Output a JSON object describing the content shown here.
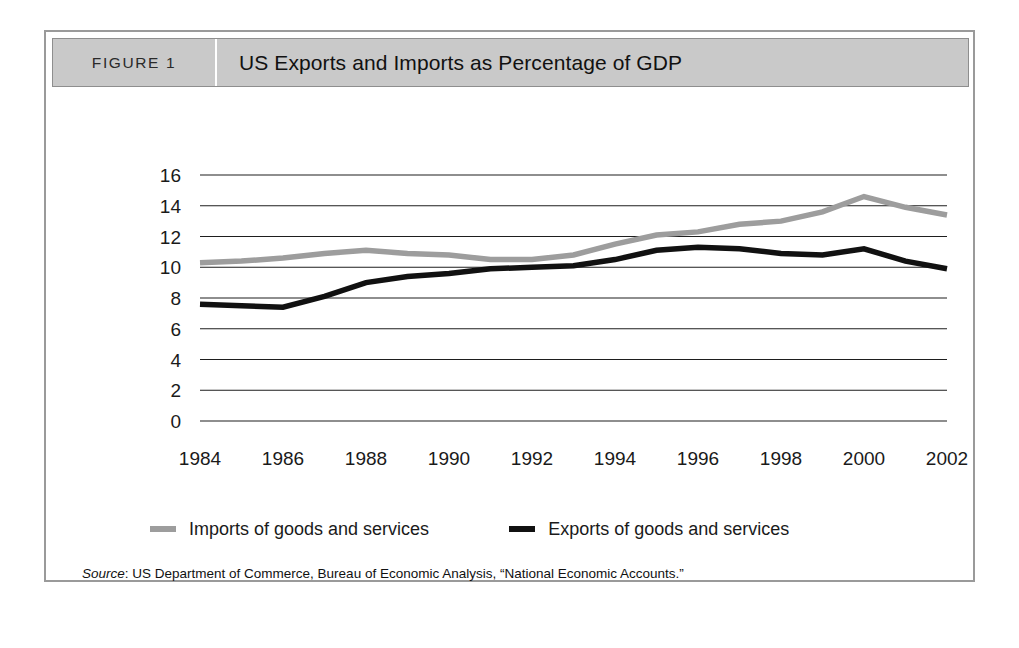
{
  "figure": {
    "number_label": "FIGURE 1",
    "title": "US Exports and Imports as Percentage of GDP",
    "source_label": "Source",
    "source_separator": ": ",
    "source_text": "US Department of Commerce, Bureau of Economic Analysis, “National Economic Accounts.”"
  },
  "colors": {
    "header_background": "#c9c9c9",
    "header_border": "#8e8e8e",
    "frame_border": "#9a9a9a",
    "imports_line": "#9d9d9d",
    "exports_line": "#111111",
    "gridline": "#1e1e1e",
    "text": "#1a1a1a",
    "page_background": "#ffffff"
  },
  "chart_data": {
    "type": "line",
    "title": "US Exports and Imports as Percentage of GDP",
    "xlabel": "",
    "ylabel": "",
    "xlim": [
      1984,
      2002
    ],
    "ylim": [
      0,
      16
    ],
    "ytick_step": 2,
    "grid": true,
    "grid_axis": "y",
    "legend_position": "bottom",
    "x": [
      1984,
      1985,
      1986,
      1987,
      1988,
      1989,
      1990,
      1991,
      1992,
      1993,
      1994,
      1995,
      1996,
      1997,
      1998,
      1999,
      2000,
      2001,
      2002
    ],
    "xtick_labels": [
      "1984",
      "1986",
      "1988",
      "1990",
      "1992",
      "1994",
      "1996",
      "1998",
      "2000",
      "2002"
    ],
    "xticks": [
      1984,
      1986,
      1988,
      1990,
      1992,
      1994,
      1996,
      1998,
      2000,
      2002
    ],
    "ytick_labels": [
      "16",
      "14",
      "12",
      "10",
      "8",
      "6",
      "4",
      "2",
      "0"
    ],
    "yticks": [
      16,
      14,
      12,
      10,
      8,
      6,
      4,
      2,
      0
    ],
    "series": [
      {
        "name": "Imports of goods and services",
        "color": "#9d9d9d",
        "width": 5.5,
        "values": [
          10.3,
          10.4,
          10.6,
          10.9,
          11.1,
          10.9,
          10.8,
          10.5,
          10.5,
          10.8,
          11.5,
          12.1,
          12.3,
          12.8,
          13.0,
          13.6,
          14.6,
          13.9,
          13.4
        ]
      },
      {
        "name": "Exports of goods and services",
        "color": "#111111",
        "width": 5.5,
        "values": [
          7.6,
          7.5,
          7.4,
          8.1,
          9.0,
          9.4,
          9.6,
          9.9,
          10.0,
          10.1,
          10.5,
          11.1,
          11.3,
          11.2,
          10.9,
          10.8,
          11.2,
          10.4,
          9.9
        ]
      }
    ]
  },
  "legend": [
    {
      "label": "Imports of goods and services",
      "swatch_color": "#9d9d9d",
      "icon": "line-swatch-icon"
    },
    {
      "label": "Exports of goods and services",
      "swatch_color": "#111111",
      "icon": "line-swatch-icon"
    }
  ]
}
